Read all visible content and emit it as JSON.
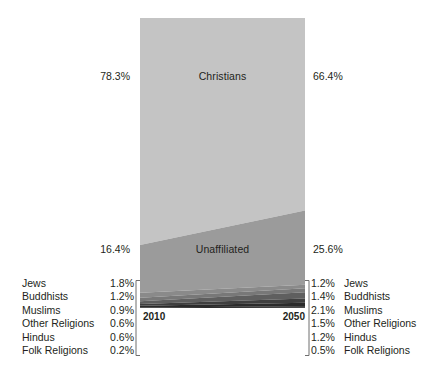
{
  "chart_data": {
    "type": "area",
    "title": "",
    "subtitle": "",
    "xlabel": "",
    "ylabel": "",
    "x": [
      "2010",
      "2050"
    ],
    "xtick_labels": [
      "2010",
      "2050"
    ],
    "ylim": [
      0,
      100
    ],
    "grid": false,
    "legend_position": "outside-left-and-right",
    "stacked": true,
    "unit": "%",
    "series": [
      {
        "name": "Christians",
        "values": [
          78.3,
          66.4
        ],
        "color": "#c4c4c4",
        "in_plot_label": true
      },
      {
        "name": "Unaffiliated",
        "values": [
          16.4,
          25.6
        ],
        "color": "#9b9b9b",
        "in_plot_label": true
      },
      {
        "name": "Jews",
        "values": [
          1.8,
          1.2
        ],
        "color": "#8a8a8a",
        "in_plot_label": false
      },
      {
        "name": "Buddhists",
        "values": [
          1.2,
          1.4
        ],
        "color": "#787878",
        "in_plot_label": false
      },
      {
        "name": "Muslims",
        "values": [
          0.9,
          2.1
        ],
        "color": "#5f5f5f",
        "in_plot_label": false
      },
      {
        "name": "Other Religions",
        "values": [
          0.6,
          1.5
        ],
        "color": "#3f3f3f",
        "in_plot_label": false
      },
      {
        "name": "Hindus",
        "values": [
          0.6,
          1.2
        ],
        "color": "#2b2b2b",
        "in_plot_label": false
      },
      {
        "name": "Folk Religions",
        "values": [
          0.2,
          0.5
        ],
        "color": "#161616",
        "in_plot_label": false
      }
    ]
  },
  "plot": {
    "christians_label": "Christians",
    "unaffiliated_label": "Unaffiliated"
  },
  "side_values": {
    "christians_2010": "78.3%",
    "christians_2050": "66.4%",
    "unaffiliated_2010": "16.4%",
    "unaffiliated_2050": "25.6%"
  },
  "axis": {
    "year_left": "2010",
    "year_right": "2050"
  },
  "legend_left": {
    "names": [
      "Jews",
      "Buddhists",
      "Muslims",
      "Other Religions",
      "Hindus",
      "Folk Religions"
    ],
    "values": [
      "1.8%",
      "1.2%",
      "0.9%",
      "0.6%",
      "0.6%",
      "0.2%"
    ]
  },
  "legend_right": {
    "names": [
      "Jews",
      "Buddhists",
      "Muslims",
      "Other Religions",
      "Hindus",
      "Folk Religions"
    ],
    "values": [
      "1.2%",
      "1.4%",
      "2.1%",
      "1.5%",
      "1.2%",
      "0.5%"
    ]
  },
  "colors": {
    "background": "#ffffff",
    "text": "#231f20",
    "christians": "#c4c4c4",
    "unaffiliated": "#9b9b9b",
    "jews": "#8a8a8a",
    "buddhists": "#787878",
    "muslims": "#5f5f5f",
    "other_religions": "#3f3f3f",
    "hindus": "#2b2b2b",
    "folk_religions": "#161616",
    "leader_line": "#6f6f6f"
  }
}
